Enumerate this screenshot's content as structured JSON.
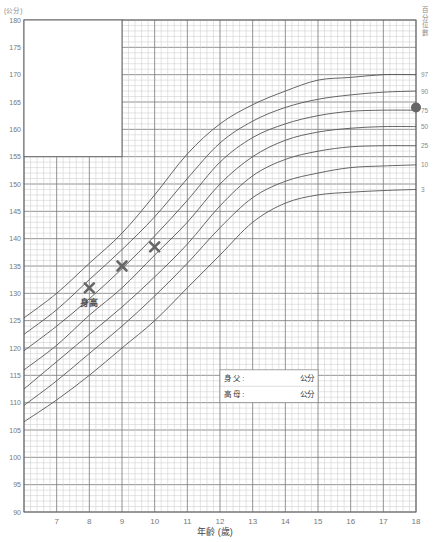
{
  "title": "",
  "y_unit_label": "(公分)",
  "percentile_header": [
    "百",
    "分",
    "位",
    "數"
  ],
  "x_axis_title": "年齡 (歲)",
  "info_box": {
    "rows": [
      {
        "label": "身 父 :",
        "unit": "公分"
      },
      {
        "label": "高 母 :",
        "unit": "公分"
      }
    ]
  },
  "point_annotation": "身高",
  "marker_color": "#666666",
  "curve_color": "#555555",
  "dot_color": "#666666",
  "chart_data": {
    "type": "line",
    "title": "",
    "xlabel": "年齡 (歲)",
    "ylabel": "(公分)",
    "xlim": [
      6,
      18
    ],
    "ylim": [
      90,
      180
    ],
    "x_ticks": [
      7,
      8,
      9,
      10,
      11,
      12,
      13,
      14,
      15,
      16,
      17,
      18
    ],
    "y_ticks": [
      90,
      95,
      100,
      105,
      110,
      115,
      120,
      125,
      130,
      135,
      140,
      145,
      150,
      155,
      160,
      165,
      170,
      175,
      180
    ],
    "grid": true,
    "legend_position": "right",
    "x": [
      6,
      7,
      8,
      9,
      10,
      11,
      12,
      13,
      14,
      15,
      16,
      17,
      18
    ],
    "series": [
      {
        "name": "97",
        "values": [
          125.5,
          130,
          135.5,
          141,
          148,
          155.5,
          161,
          164.5,
          167,
          169,
          169.5,
          170,
          170
        ]
      },
      {
        "name": "90",
        "values": [
          122.5,
          127,
          132.5,
          138,
          144,
          151,
          157.5,
          161.5,
          164,
          165.5,
          166.3,
          166.8,
          167
        ]
      },
      {
        "name": "75",
        "values": [
          119.5,
          124,
          129,
          134.5,
          140.5,
          147,
          154,
          158.5,
          161,
          162.5,
          163.3,
          163.5,
          163.5
        ]
      },
      {
        "name": "50",
        "values": [
          116,
          120.5,
          126,
          131,
          137,
          143,
          150,
          155,
          158,
          159.5,
          160.2,
          160.5,
          160.5
        ]
      },
      {
        "name": "25",
        "values": [
          112.5,
          117.5,
          122.5,
          127.5,
          133,
          139,
          146,
          151.5,
          154.5,
          156,
          156.8,
          157,
          157
        ]
      },
      {
        "name": "10",
        "values": [
          109.5,
          114,
          119,
          124,
          129.5,
          135.5,
          142,
          147.5,
          150.5,
          152,
          153,
          153.3,
          153.5
        ]
      },
      {
        "name": "3",
        "values": [
          106.5,
          110.5,
          115,
          120,
          125,
          131,
          137,
          143,
          146.5,
          148,
          148.5,
          148.8,
          149
        ]
      }
    ],
    "measurements": [
      {
        "age": 8,
        "height": 131
      },
      {
        "age": 9,
        "height": 135
      },
      {
        "age": 10,
        "height": 138.5
      }
    ],
    "target_marker": {
      "age": 18,
      "height": 164
    },
    "annotations": [
      "身高",
      "身 父 : 公分",
      "高 母 : 公分"
    ]
  }
}
